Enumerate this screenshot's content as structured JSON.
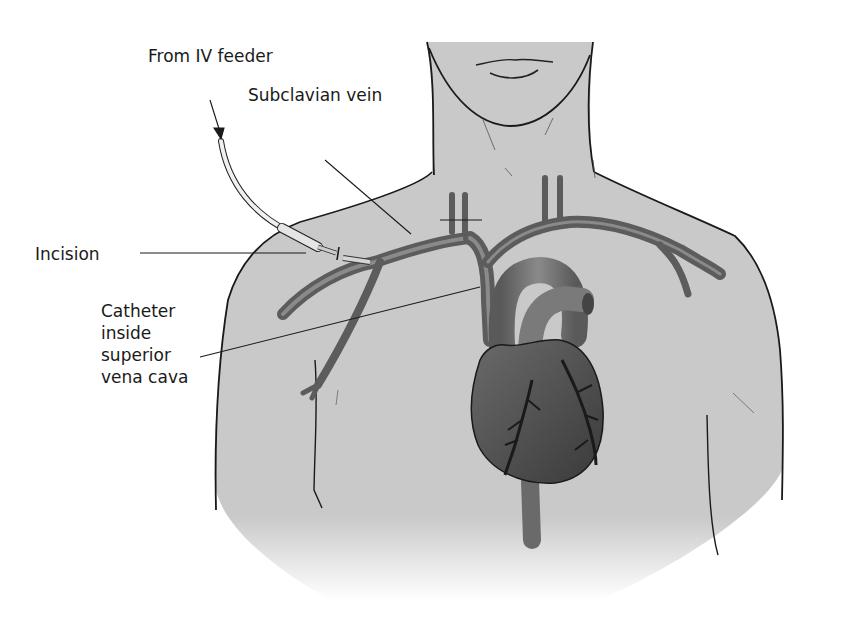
{
  "figure": {
    "labels": {
      "iv_feeder": "From IV feeder",
      "subclavian_vein": "Subclavian vein",
      "incision": "Incision",
      "catheter": {
        "line1": "Catheter",
        "line2": "inside",
        "line3": "superior",
        "line4": "vena cava"
      }
    },
    "colors": {
      "skin": "#c9c9c9",
      "outline": "#1a1a1a",
      "vessel": "#6e6e6e",
      "vessel_dark": "#4a4a4a",
      "heart": "#555555",
      "tube": "#e8e8e8",
      "background": "#ffffff"
    }
  }
}
